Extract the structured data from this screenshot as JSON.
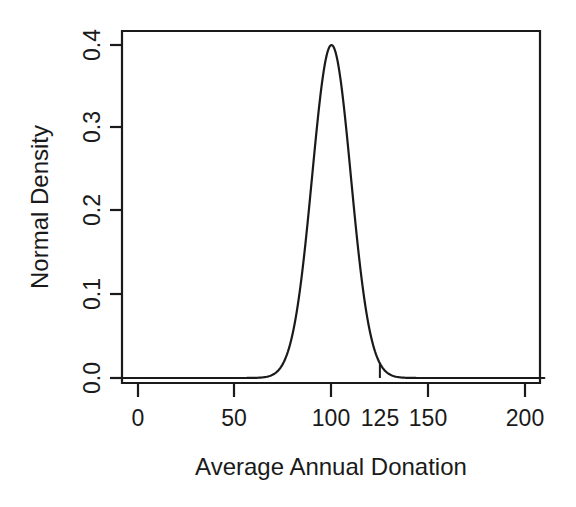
{
  "chart_data": {
    "type": "line",
    "title": "",
    "subtitle": "",
    "xlabel": "Average Annual Donation",
    "ylabel": "Normal Density",
    "xlim": [
      -10,
      210
    ],
    "ylim": [
      0.0,
      0.42
    ],
    "grid": false,
    "legend": null,
    "x_ticks": [
      0,
      50,
      100,
      150,
      200
    ],
    "x_tick_labels": [
      "0",
      "50",
      "100",
      "125",
      "150",
      "200"
    ],
    "x_label_values": [
      0,
      50,
      100,
      125,
      150,
      200
    ],
    "y_ticks": [
      0.0,
      0.1,
      0.2,
      0.3,
      0.4
    ],
    "y_tick_labels": [
      "0.0",
      "0.1",
      "0.2",
      "0.3",
      "0.4"
    ],
    "distribution": {
      "name": "normal-density-curve",
      "mean": 100,
      "sd": 10,
      "peak_x": 100,
      "peak_y": 0.4,
      "visible_left_tail_x": 57,
      "visible_right_tail_x": 147
    },
    "annotations": [
      {
        "name": "cutoff-marker",
        "type": "vertical-line",
        "x": 125,
        "y_from": 0.0,
        "y_to": 0.06,
        "label": ""
      }
    ],
    "series": [
      {
        "name": "Normal Density",
        "x": [
          50,
          55,
          60,
          65,
          70,
          75,
          80,
          85,
          90,
          95,
          100,
          105,
          110,
          115,
          120,
          125,
          130,
          135,
          140,
          145,
          150
        ],
        "values": [
          0.0,
          0.0,
          0.0001,
          0.0004,
          0.0018,
          0.0066,
          0.018,
          0.0352,
          0.0484,
          0.04,
          0.0399,
          0.04,
          0.0484,
          0.0352,
          0.018,
          0.0066,
          0.0018,
          0.0004,
          0.0001,
          0.0,
          0.0
        ]
      }
    ],
    "density_values_scaled": {
      "note": "curve peak normalized to 0.4 at x=100",
      "x": [
        50,
        60,
        70,
        75,
        80,
        85,
        90,
        95,
        100,
        105,
        110,
        115,
        120,
        125,
        130,
        140,
        150
      ],
      "y": [
        0.0,
        0.0001,
        0.0018,
        0.0066,
        0.0216,
        0.054,
        0.108,
        0.1761,
        0.4,
        0.1761,
        0.108,
        0.054,
        0.0216,
        0.06,
        0.0018,
        0.0001,
        0.0
      ]
    }
  },
  "axis": {
    "y_title": "Normal Density",
    "x_title": "Average Annual Donation"
  },
  "colors": {
    "line": "#1a1a1a",
    "background": "#ffffff",
    "text": "#1a1a1a"
  }
}
